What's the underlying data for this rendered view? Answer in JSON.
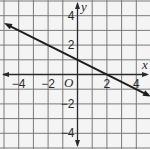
{
  "chart_data": {
    "type": "line",
    "title": "",
    "xlabel": "x",
    "ylabel": "y",
    "origin_label": "O",
    "xlim": [
      -5,
      5
    ],
    "ylim": [
      -5,
      5
    ],
    "grid": true,
    "grid_step": 1,
    "x_ticks": [
      {
        "value": -4,
        "label": "−4"
      },
      {
        "value": -2,
        "label": "−2"
      },
      {
        "value": 2,
        "label": "2"
      },
      {
        "value": 4,
        "label": "4"
      }
    ],
    "y_ticks": [
      {
        "value": 4,
        "label": "4"
      },
      {
        "value": 2,
        "label": "2"
      },
      {
        "value": -2,
        "label": "−2"
      },
      {
        "value": -4,
        "label": "−4"
      }
    ],
    "series": [
      {
        "name": "line",
        "equation": "y = -1/2 x + 1",
        "slope": -0.5,
        "intercept": 1,
        "x": [
          -5,
          -4,
          -2,
          0,
          2,
          4,
          5
        ],
        "y": [
          3.5,
          3,
          2,
          1,
          0,
          -1,
          -1.5
        ],
        "arrows": "both",
        "color": "#1e1e1e"
      }
    ],
    "legend": null
  },
  "style": {
    "background": "#f4f4f4",
    "grid_color": "#7a7a7a",
    "axis_color": "#2a2a2a",
    "line_color": "#1e1e1e"
  }
}
